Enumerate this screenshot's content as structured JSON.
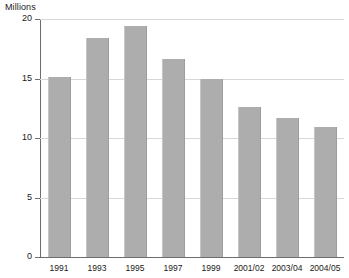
{
  "chart_data": {
    "type": "bar",
    "title": "",
    "subtitle": "",
    "xlabel": "",
    "ylabel": "Millions",
    "ylim": [
      0,
      20
    ],
    "ytick_values": [
      0,
      5,
      10,
      15,
      20
    ],
    "ytick_labels": [
      "0",
      "5",
      "10",
      "15",
      "20"
    ],
    "grid": true,
    "legend": false,
    "legend_position": "none",
    "categories": [
      "1991",
      "1993",
      "1995",
      "1997",
      "1999",
      "2001/02",
      "2003/04",
      "2004/05"
    ],
    "values": [
      15.1,
      18.4,
      19.4,
      16.6,
      15.0,
      12.6,
      11.7,
      10.9
    ],
    "bar_color": "#adadad",
    "gridline_color": "#d8d8d8",
    "axis_color": "#6d6d6d",
    "bars": [
      {
        "category": "1991",
        "value": 15.1
      },
      {
        "category": "1993",
        "value": 18.4
      },
      {
        "category": "1995",
        "value": 19.4
      },
      {
        "category": "1997",
        "value": 16.6
      },
      {
        "category": "1999",
        "value": 15.0
      },
      {
        "category": "2001/02",
        "value": 12.6
      },
      {
        "category": "2003/04",
        "value": 11.7
      },
      {
        "category": "2004/05",
        "value": 10.9
      }
    ]
  },
  "axis": {
    "unit_caption": "Millions"
  }
}
